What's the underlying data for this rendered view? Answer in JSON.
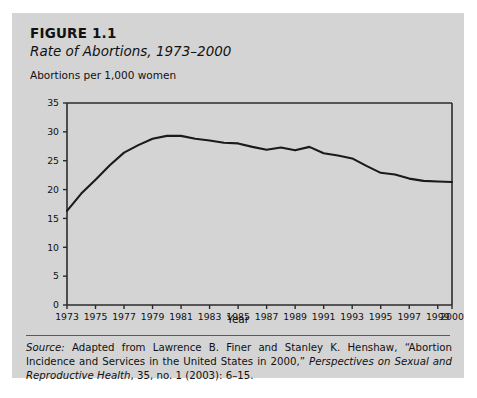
{
  "figure": {
    "number_label": "FIGURE 1.1",
    "title": "Rate of Abortions, 1973–2000",
    "axis_note": "Abortions per 1,000 women",
    "source_prefix": "Source:",
    "source_text_1": " Adapted from Lawrence B. Finer and Stanley K. Henshaw, “Abortion Incidence and Services in the United States in 2000,” ",
    "source_italic": "Perspectives on Sexual and Reproductive Health",
    "source_text_2": ", 35, no. 1 (2003): 6–15."
  },
  "colors": {
    "panel_background": "#d4d4d4",
    "line": "#1a1a1a",
    "axis": "#2b2b2b",
    "text": "#111111"
  },
  "chart_data": {
    "type": "line",
    "title": "Rate of Abortions, 1973–2000",
    "xlabel": "Year",
    "ylabel": "Abortions per 1,000 women",
    "ylim": [
      0,
      35
    ],
    "xlim": [
      1973,
      2000
    ],
    "ytick_labels": [
      "0",
      "5",
      "10",
      "15",
      "20",
      "25",
      "30",
      "35"
    ],
    "yticks": [
      0,
      5,
      10,
      15,
      20,
      25,
      30,
      35
    ],
    "xtick_labels": [
      "1973",
      "1975",
      "1977",
      "1979",
      "1981",
      "1983",
      "1985",
      "1987",
      "1989",
      "1991",
      "1993",
      "1995",
      "1997",
      "1999",
      "2000"
    ],
    "xticks": [
      1973,
      1975,
      1977,
      1979,
      1981,
      1983,
      1985,
      1987,
      1989,
      1991,
      1993,
      1995,
      1997,
      1999,
      2000
    ],
    "grid": false,
    "legend": false,
    "x": [
      1973,
      1974,
      1975,
      1976,
      1977,
      1978,
      1979,
      1980,
      1981,
      1982,
      1983,
      1984,
      1985,
      1986,
      1987,
      1988,
      1989,
      1990,
      1991,
      1992,
      1993,
      1994,
      1995,
      1996,
      1997,
      1998,
      1999,
      2000
    ],
    "values": [
      16.3,
      19.3,
      21.7,
      24.2,
      26.4,
      27.7,
      28.8,
      29.3,
      29.3,
      28.8,
      28.5,
      28.1,
      28.0,
      27.4,
      26.9,
      27.3,
      26.8,
      27.4,
      26.3,
      25.9,
      25.4,
      24.1,
      22.9,
      22.6,
      21.9,
      21.5,
      21.4,
      21.3
    ],
    "series": [
      {
        "name": "Abortions per 1,000 women aged 15–44",
        "values": [
          16.3,
          19.3,
          21.7,
          24.2,
          26.4,
          27.7,
          28.8,
          29.3,
          29.3,
          28.8,
          28.5,
          28.1,
          28.0,
          27.4,
          26.9,
          27.3,
          26.8,
          27.4,
          26.3,
          25.9,
          25.4,
          24.1,
          22.9,
          22.6,
          21.9,
          21.5,
          21.4,
          21.3
        ]
      }
    ]
  }
}
